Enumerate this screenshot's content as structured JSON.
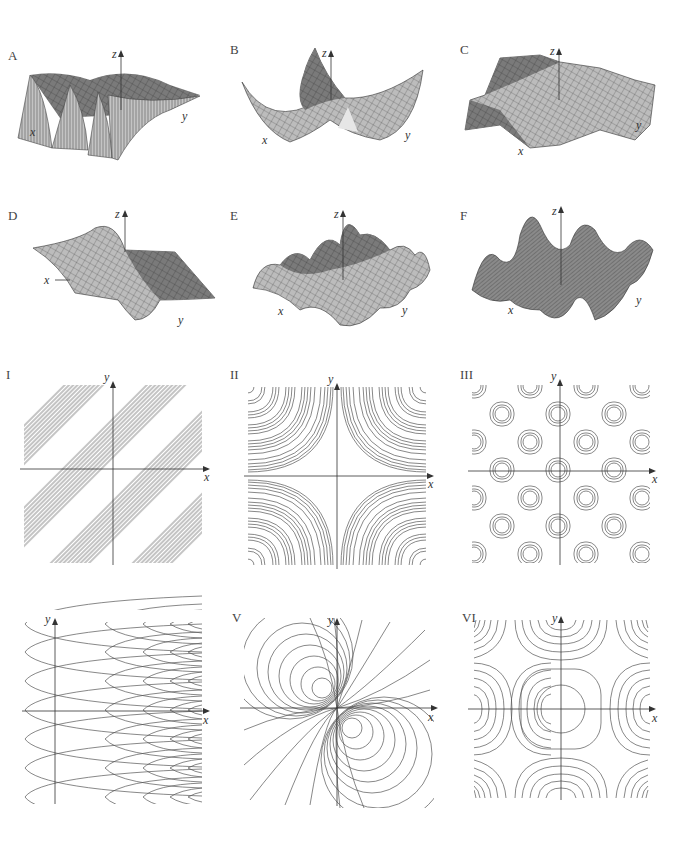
{
  "surfaces": [
    {
      "label": "A",
      "axes": {
        "x": "x",
        "y": "y",
        "z": "z"
      }
    },
    {
      "label": "B",
      "axes": {
        "x": "x",
        "y": "y",
        "z": "z"
      }
    },
    {
      "label": "C",
      "axes": {
        "x": "x",
        "y": "y",
        "z": "z"
      }
    },
    {
      "label": "D",
      "axes": {
        "x": "x",
        "y": "y",
        "z": "z"
      }
    },
    {
      "label": "E",
      "axes": {
        "x": "x",
        "y": "y",
        "z": "z"
      }
    },
    {
      "label": "F",
      "axes": {
        "x": "x",
        "y": "y",
        "z": "z"
      }
    }
  ],
  "contour_maps": [
    {
      "label": "I",
      "axes": {
        "x": "x",
        "y": "y"
      },
      "pattern": "diagonal bands of parallel lines"
    },
    {
      "label": "II",
      "axes": {
        "x": "x",
        "y": "y"
      },
      "pattern": "hyperbolic curves, dense at corners"
    },
    {
      "label": "III",
      "axes": {
        "x": "x",
        "y": "y"
      },
      "pattern": "periodic grid of closed loops"
    },
    {
      "label": "IV",
      "axes": {
        "x": "x",
        "y": "y"
      },
      "pattern": "nested parabolas opening right, periodic in y"
    },
    {
      "label": "V",
      "axes": {
        "x": "x",
        "y": "y"
      },
      "pattern": "dipole circles through origin"
    },
    {
      "label": "VI",
      "axes": {
        "x": "x",
        "y": "y"
      },
      "pattern": "closed loop at origin with saddle regions"
    }
  ],
  "colors": {
    "surface_fill": "#b8b8b8",
    "surface_dark": "#6e6e6e",
    "mesh": "#333333",
    "contour": "#555555",
    "axis": "#333333"
  }
}
